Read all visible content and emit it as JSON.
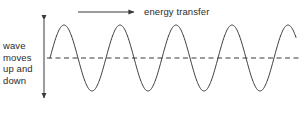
{
  "figure": {
    "background_color": "#ffffff",
    "stroke_color": "#3a3a3a",
    "text_color": "#2b2b2b"
  },
  "annotations": {
    "energy_transfer": {
      "text": "energy transfer",
      "arrow": "horizontal-right-arrow"
    },
    "wave_motion": {
      "text": "wave\nmoves\nup and\ndown",
      "arrow": "vertical-double-arrow"
    }
  },
  "chart_data": {
    "type": "line",
    "xlabel": "",
    "ylabel": "",
    "grid": false,
    "legend": false,
    "series": [
      {
        "name": "wave",
        "waveform": "sine",
        "start_x": 50,
        "end_x": 296,
        "baseline_y": 58,
        "amplitude": 33,
        "wavelength": 56,
        "cycles": 4.4,
        "peaks_x": [
          64,
          120,
          176,
          232,
          288
        ],
        "troughs_x": [
          92,
          148,
          204,
          260
        ],
        "zero_crossings_x": [
          50,
          78,
          106,
          134,
          162,
          190,
          218,
          246,
          274
        ]
      }
    ],
    "reference_line": {
      "name": "equilibrium",
      "style": "dashed",
      "y": 58,
      "x_start": 47,
      "x_end": 300
    },
    "arrows": [
      {
        "name": "energy-transfer-arrow",
        "direction": "right",
        "x_start": 78,
        "x_end": 137,
        "y": 12
      },
      {
        "name": "displacement-arrow",
        "direction": "both",
        "x": 44,
        "y_start": 17,
        "y_end": 101
      }
    ]
  }
}
